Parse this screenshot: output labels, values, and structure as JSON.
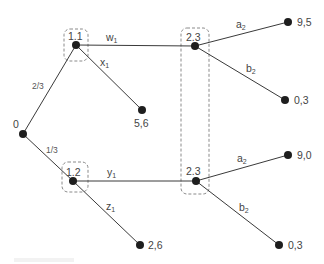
{
  "diagram": {
    "type": "extensive-form game tree",
    "root": {
      "label": "0"
    },
    "chance_probabilities": {
      "upper": "2/3",
      "lower": "1/3"
    },
    "player1_nodes": [
      {
        "label": "1.1",
        "action_continue": "w",
        "action_continue_sub": "1",
        "action_stop": "x",
        "action_stop_sub": "1",
        "stop_payoff": "5,6"
      },
      {
        "label": "1.2",
        "action_continue": "y",
        "action_continue_sub": "1",
        "action_stop": "z",
        "action_stop_sub": "1",
        "stop_payoff": "2,6"
      }
    ],
    "player2_nodes": [
      {
        "label": "2.3",
        "a": "a",
        "a_sub": "2",
        "b": "b",
        "b_sub": "2",
        "a_payoff": "9,5",
        "b_payoff": "0,3"
      },
      {
        "label": "2.3",
        "a": "a",
        "a_sub": "2",
        "b": "b",
        "b_sub": "2",
        "a_payoff": "9,0",
        "b_payoff": "0,3"
      }
    ]
  }
}
